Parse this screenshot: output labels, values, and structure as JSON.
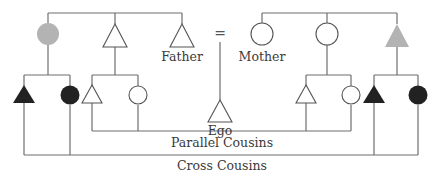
{
  "diagram": {
    "type": "kinship-chart",
    "colors": {
      "line": "#6e6e6e",
      "outline": "#555555",
      "grey_fill": "#b3b3b3",
      "black_fill": "#222222",
      "white_fill": "#ffffff"
    },
    "labels": {
      "father": "Father",
      "mother": "Mother",
      "ego": "Ego",
      "marriage_symbol": "=",
      "parallel_cousins": "Parallel Cousins",
      "cross_cousins": "Cross Cousins"
    },
    "generations": {
      "parents": [
        {
          "id": "fathers-sister",
          "shape": "circle",
          "fill": "grey"
        },
        {
          "id": "fathers-brother",
          "shape": "triangle",
          "fill": "white"
        },
        {
          "id": "father",
          "shape": "triangle",
          "fill": "white",
          "label": "Father"
        },
        {
          "id": "mother",
          "shape": "circle",
          "fill": "white",
          "label": "Mother"
        },
        {
          "id": "mothers-sister",
          "shape": "circle",
          "fill": "white"
        },
        {
          "id": "mothers-brother",
          "shape": "triangle",
          "fill": "grey"
        }
      ],
      "ego": {
        "shape": "triangle",
        "fill": "white",
        "label": "Ego"
      },
      "cousins": [
        {
          "id": "fzs",
          "shape": "triangle",
          "fill": "black",
          "group": "cross"
        },
        {
          "id": "fzd",
          "shape": "circle",
          "fill": "black",
          "group": "cross"
        },
        {
          "id": "fbs",
          "shape": "triangle",
          "fill": "white",
          "group": "parallel"
        },
        {
          "id": "fbd",
          "shape": "circle",
          "fill": "white",
          "group": "parallel"
        },
        {
          "id": "mzs",
          "shape": "triangle",
          "fill": "white",
          "group": "parallel"
        },
        {
          "id": "mzd",
          "shape": "circle",
          "fill": "white",
          "group": "parallel"
        },
        {
          "id": "mbs",
          "shape": "triangle",
          "fill": "black",
          "group": "cross"
        },
        {
          "id": "mbd",
          "shape": "circle",
          "fill": "black",
          "group": "cross"
        }
      ]
    }
  }
}
